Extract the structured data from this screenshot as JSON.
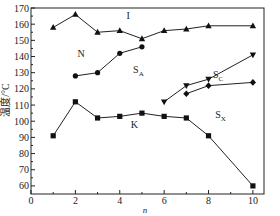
{
  "chart_data": {
    "type": "line",
    "title": "",
    "xlabel": "n",
    "ylabel": "温度/°C",
    "xlim": [
      0,
      10.5
    ],
    "ylim": [
      55,
      170
    ],
    "xticks": [
      0,
      2,
      4,
      6,
      8,
      10
    ],
    "yticks": [
      60,
      70,
      80,
      90,
      100,
      110,
      120,
      130,
      140,
      150,
      160,
      170
    ],
    "grid": false,
    "series": [
      {
        "name": "I (clearing)",
        "marker": "triangle-up",
        "x": [
          1,
          2,
          3,
          4,
          5,
          6,
          7,
          8,
          10
        ],
        "y": [
          158,
          166,
          155,
          156,
          151,
          156,
          157,
          159,
          159
        ]
      },
      {
        "name": "N-SA",
        "marker": "circle",
        "x": [
          2,
          3,
          4,
          5
        ],
        "y": [
          128,
          130,
          142,
          146
        ]
      },
      {
        "name": "SA-SC",
        "marker": "triangle-down",
        "x": [
          6,
          7,
          8,
          10
        ],
        "y": [
          112,
          122,
          126,
          141
        ]
      },
      {
        "name": "SC-SX",
        "marker": "diamond",
        "x": [
          7,
          8,
          10
        ],
        "y": [
          117,
          122,
          124
        ]
      },
      {
        "name": "K (melting)",
        "marker": "square",
        "x": [
          1,
          2,
          3,
          4,
          5,
          6,
          7,
          8,
          10
        ],
        "y": [
          91,
          112,
          102,
          103,
          105,
          103,
          102,
          91,
          60
        ]
      }
    ],
    "annotations": [
      {
        "text": "I",
        "x": 4.3,
        "y": 163
      },
      {
        "text": "N",
        "x": 2.1,
        "y": 140
      },
      {
        "text": "S",
        "sub": "A",
        "x": 4.6,
        "y": 130
      },
      {
        "text": "S",
        "sub": "C",
        "x": 8.2,
        "y": 127
      },
      {
        "text": "S",
        "sub": "X",
        "x": 8.3,
        "y": 102
      },
      {
        "text": "K",
        "x": 4.5,
        "y": 96
      }
    ]
  }
}
